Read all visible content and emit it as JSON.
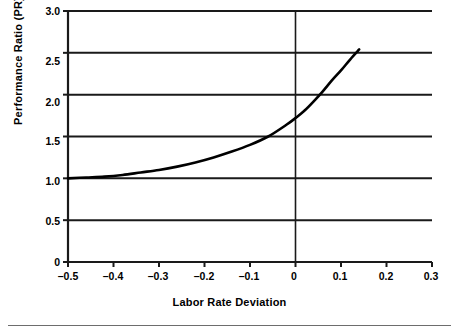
{
  "figure": {
    "width": 459,
    "height": 331,
    "background": "#ffffff",
    "line_color": "#000000",
    "grid_color": "#1a1a1a",
    "rule_color": "#6d6d6d"
  },
  "axes": {
    "x_title": "Labor Rate Deviation",
    "y_title": "Performance Ratio (PR)"
  },
  "chart_data": {
    "type": "line",
    "title": "",
    "subtitle": "",
    "xlabel": "Labor Rate Deviation",
    "ylabel": "Performance Ratio (PR)",
    "xlim": [
      -0.5,
      0.3
    ],
    "ylim": [
      0,
      3.0
    ],
    "xticks": [
      -0.5,
      -0.4,
      -0.3,
      -0.2,
      -0.1,
      0,
      0.1,
      0.2,
      0.3
    ],
    "xticklabels": [
      "–0.5",
      "–0.4",
      "–0.3",
      "–0.2",
      "–0.1",
      "0",
      "0.1",
      "0.2",
      "0.3"
    ],
    "yticks": [
      0,
      0.5,
      1.0,
      1.5,
      2.0,
      2.5,
      3.0
    ],
    "yticklabels": [
      "0",
      "0.5",
      "1.0",
      "1.5",
      "2.0",
      "2.5",
      "3.0"
    ],
    "grid": "horizontal",
    "legend": "none",
    "annotations": [],
    "series": [
      {
        "name": "Performance Ratio",
        "color": "#000000",
        "linewidth": 2.6,
        "x": [
          -0.5,
          -0.46,
          -0.42,
          -0.38,
          -0.34,
          -0.3,
          -0.26,
          -0.22,
          -0.18,
          -0.14,
          -0.1,
          -0.06,
          -0.02,
          0.0,
          0.02,
          0.04,
          0.06,
          0.08,
          0.1,
          0.12,
          0.14
        ],
        "y": [
          1.0,
          1.01,
          1.02,
          1.04,
          1.07,
          1.1,
          1.14,
          1.19,
          1.25,
          1.32,
          1.4,
          1.5,
          1.64,
          1.72,
          1.81,
          1.92,
          2.04,
          2.17,
          2.29,
          2.42,
          2.54
        ]
      }
    ],
    "vertical_reference_line": {
      "x": 0,
      "color": "#1a1a1a",
      "note": "vertical axis drawn at Labor Rate Deviation = 0"
    }
  }
}
